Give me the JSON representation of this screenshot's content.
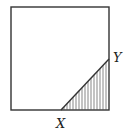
{
  "diagram": {
    "shape": "square",
    "labels": {
      "x_point": "X",
      "y_point": "Y"
    },
    "shaded_region": "right triangle between X, bottom-right corner, and Y",
    "hatch_style": "vertical lines",
    "stroke_color": "#333333"
  }
}
